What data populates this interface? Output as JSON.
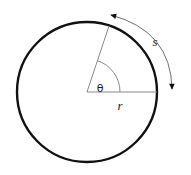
{
  "figure": {
    "type": "geometry-diagram",
    "canvas": {
      "width": 191,
      "height": 175,
      "background": "#ffffff"
    }
  },
  "colors": {
    "circle_stroke": "#111111",
    "radius_stroke": "#8a8a8a",
    "angle_arc_stroke": "#8a8a8a",
    "arrow_stroke": "#6f6f6f",
    "arrowhead_fill": "#111111",
    "label_color": "#1a1a1a",
    "background": "#ffffff"
  },
  "circle": {
    "center_x": 87,
    "center_y": 92,
    "radius": 70,
    "stroke_width": 2.4
  },
  "radii": {
    "horizontal": {
      "from_x": 87,
      "from_y": 92,
      "to_x": 157,
      "to_y": 92,
      "stroke_width": 1
    },
    "angled": {
      "from_x": 87,
      "from_y": 92,
      "to_x": 109,
      "to_y": 26,
      "angle_degrees": 72,
      "stroke_width": 1
    }
  },
  "angle_arc": {
    "radius": 33,
    "start_x": 120,
    "start_y": 92,
    "end_x": 97,
    "end_y": 61,
    "stroke_width": 1
  },
  "arc_arrow": {
    "start_x": 111,
    "start_y": 15,
    "end_x": 172,
    "end_y": 89,
    "control_x": 171,
    "control_y": 31,
    "stroke_width": 1,
    "double_headed": true,
    "head_start_direction": "up-left",
    "head_end_direction": "down"
  },
  "labels": {
    "arc_length": {
      "text": "s",
      "x": 155,
      "y": 46,
      "font_size": 13,
      "italic": true
    },
    "radius": {
      "text": "r",
      "x": 120,
      "y": 110,
      "font_size": 13,
      "italic": true
    },
    "angle": {
      "text": "θ",
      "x": 100,
      "y": 92,
      "font_size": 11,
      "italic": false
    }
  }
}
